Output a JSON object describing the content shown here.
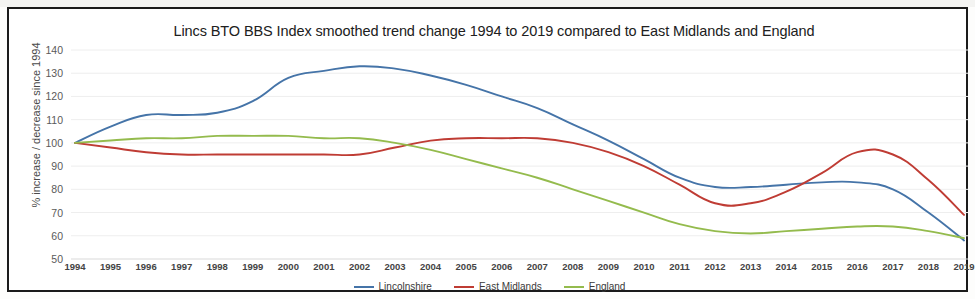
{
  "chart_data": {
    "type": "line",
    "title": "Lincs BTO BBS Index smoothed trend change 1994 to 2019 compared to East Midlands and England",
    "xlabel": "",
    "ylabel": "% increase / decrease since 1994",
    "ylim": [
      50,
      140
    ],
    "yticks": [
      50,
      60,
      70,
      80,
      90,
      100,
      110,
      120,
      130,
      140
    ],
    "grid": true,
    "legend_position": "bottom",
    "categories": [
      "1994",
      "1995",
      "1996",
      "1997",
      "1998",
      "1999",
      "2000",
      "2001",
      "2002",
      "2003",
      "2004",
      "2005",
      "2006",
      "2007",
      "2008",
      "2009",
      "2010",
      "2011",
      "2012",
      "2013",
      "2014",
      "2015",
      "2016",
      "2017",
      "2018",
      "2019"
    ],
    "series": [
      {
        "name": "Lincolnshire",
        "color": "#4574a8",
        "values": [
          100,
          107,
          112,
          112,
          113,
          118,
          128,
          131,
          133,
          132,
          129,
          125,
          120,
          115,
          108,
          101,
          93,
          85,
          81,
          81,
          82,
          83,
          83,
          80,
          70,
          58
        ]
      },
      {
        "name": "East Midlands",
        "color": "#bf3c34",
        "values": [
          100,
          98,
          96,
          95,
          95,
          95,
          95,
          95,
          95,
          98,
          101,
          102,
          102,
          102,
          100,
          96,
          90,
          82,
          74,
          74,
          79,
          87,
          96,
          95,
          84,
          69
        ]
      },
      {
        "name": "England",
        "color": "#94bb4d",
        "values": [
          100,
          101,
          102,
          102,
          103,
          103,
          103,
          102,
          102,
          100,
          97,
          93,
          89,
          85,
          80,
          75,
          70,
          65,
          62,
          61,
          62,
          63,
          64,
          64,
          62,
          59
        ]
      }
    ]
  },
  "legend": {
    "items": [
      {
        "label": "Lincolnshire",
        "color": "#4574a8"
      },
      {
        "label": "East Midlands",
        "color": "#bf3c34"
      },
      {
        "label": "England",
        "color": "#94bb4d"
      }
    ]
  }
}
